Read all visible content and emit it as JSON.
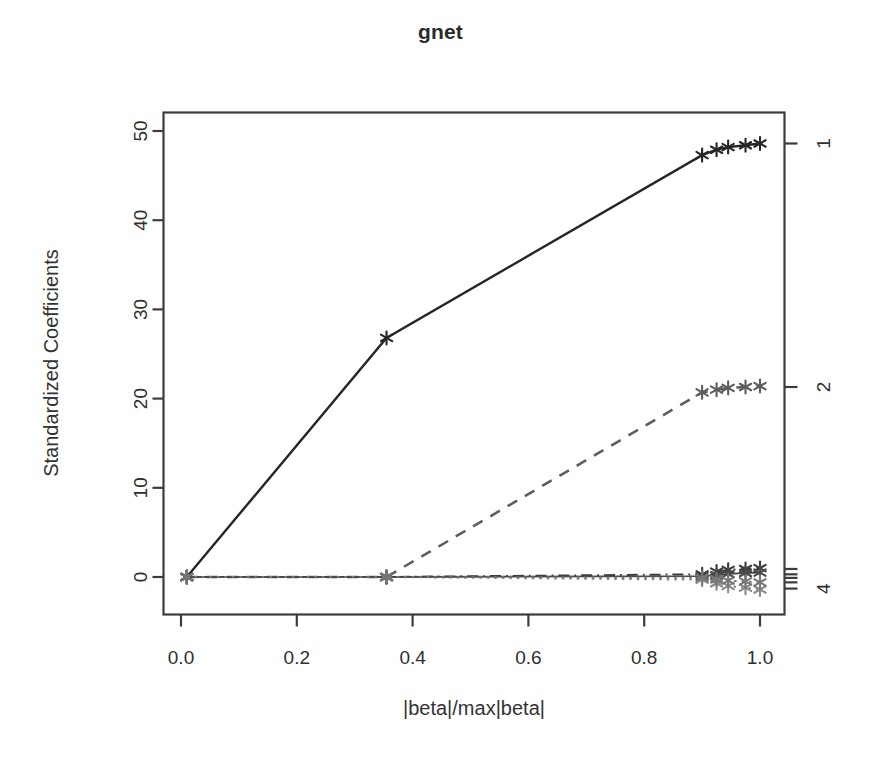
{
  "chart_data": {
    "type": "line",
    "title": "gnet",
    "xlabel": "|beta|/max|beta|",
    "ylabel": "Standardized Coefficients",
    "xlim": [
      -0.03,
      1.06
    ],
    "ylim": [
      -2.5,
      51.5
    ],
    "xticks": [
      0.0,
      0.2,
      0.4,
      0.6,
      0.8,
      1.0
    ],
    "xtick_labels": [
      "0.0",
      "0.2",
      "0.4",
      "0.6",
      "0.8",
      "1.0"
    ],
    "yticks": [
      0,
      10,
      20,
      30,
      40,
      50
    ],
    "ytick_labels": [
      "0",
      "10",
      "20",
      "30",
      "40",
      "50"
    ],
    "grid": false,
    "legend": null,
    "right_axis": {
      "label_name": "variable-index",
      "ticks": [
        {
          "value": 48.6,
          "label": "1"
        },
        {
          "value": 21.3,
          "label": "2"
        },
        {
          "value": 0.9,
          "label": ""
        },
        {
          "value": 0.3,
          "label": ""
        },
        {
          "value": -0.1,
          "label": ""
        },
        {
          "value": -0.6,
          "label": ""
        },
        {
          "value": -1.3,
          "label": "4"
        }
      ]
    },
    "marker": "asterisk",
    "series": [
      {
        "name": "1",
        "color": "#262626",
        "linestyle": "solid",
        "x": [
          0.01,
          0.355,
          0.9,
          0.925,
          0.945,
          0.975,
          1.0
        ],
        "values": [
          0.0,
          26.8,
          47.3,
          47.9,
          48.2,
          48.4,
          48.6
        ]
      },
      {
        "name": "2",
        "color": "#5e5e5e",
        "linestyle": "dashed",
        "x": [
          0.01,
          0.355,
          0.9,
          0.925,
          0.945,
          0.975,
          1.0
        ],
        "values": [
          0.0,
          0.0,
          20.7,
          21.0,
          21.2,
          21.3,
          21.4
        ]
      },
      {
        "name": "3",
        "color": "#3a3a3a",
        "linestyle": "dotdash",
        "x": [
          0.01,
          0.355,
          0.9,
          0.925,
          0.945,
          0.975,
          1.0
        ],
        "values": [
          0.0,
          0.0,
          0.3,
          0.6,
          0.8,
          0.9,
          1.0
        ]
      },
      {
        "name": "4",
        "color": "#8a8a8a",
        "linestyle": "dotted",
        "x": [
          0.01,
          0.355,
          0.9,
          0.925,
          0.945,
          0.975,
          1.0
        ],
        "values": [
          0.0,
          0.0,
          -0.3,
          -0.7,
          -1.0,
          -1.2,
          -1.4
        ]
      },
      {
        "name": "5",
        "color": "#4a4a4a",
        "linestyle": "solid-thin",
        "x": [
          0.01,
          0.355,
          0.9,
          0.925,
          0.945,
          0.975,
          1.0
        ],
        "values": [
          0.0,
          0.0,
          0.1,
          0.2,
          0.35,
          0.45,
          0.5
        ]
      },
      {
        "name": "6",
        "color": "#777777",
        "linestyle": "dotted",
        "x": [
          0.01,
          0.355,
          0.9,
          0.925,
          0.945,
          0.975,
          1.0
        ],
        "values": [
          0.0,
          0.0,
          -0.1,
          -0.25,
          -0.4,
          -0.5,
          -0.6
        ]
      }
    ],
    "vertical_breaks": [
      0.01,
      0.355,
      0.9
    ]
  }
}
